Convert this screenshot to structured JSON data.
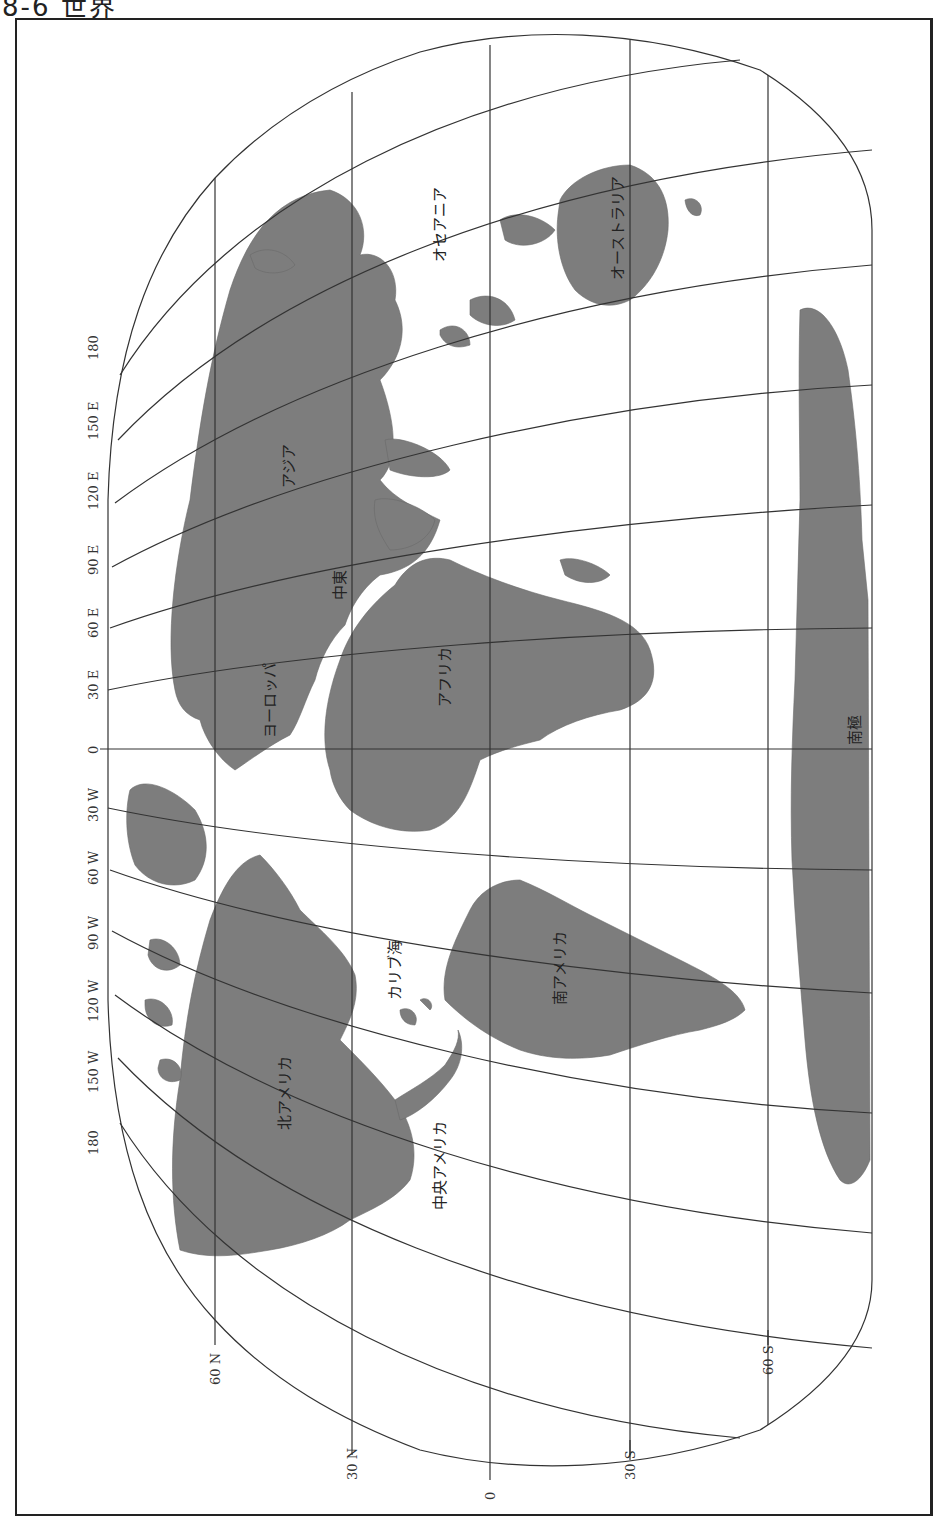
{
  "page": {
    "title": "8-6 世界"
  },
  "map": {
    "projection_orientation": "rotated 90° — north at left, south at right",
    "colors": {
      "land": "#7d7d7d",
      "water": "#ffffff",
      "gridlines": "#333333",
      "frame": "#222222"
    },
    "latitude_labels": [
      {
        "label": "60 N",
        "x": 215
      },
      {
        "label": "30 N",
        "x": 352
      },
      {
        "label": "0",
        "x": 490
      },
      {
        "label": "30 S",
        "x": 630
      },
      {
        "label": "60 S",
        "x": 768
      }
    ],
    "longitude_labels": [
      {
        "label": "180",
        "y": 345
      },
      {
        "label": "150 E",
        "y": 415
      },
      {
        "label": "120 E",
        "y": 490
      },
      {
        "label": "90 E",
        "y": 560
      },
      {
        "label": "60 E",
        "y": 630
      },
      {
        "label": "30 E",
        "y": 690
      },
      {
        "label": "0",
        "y": 749
      },
      {
        "label": "30 W",
        "y": 808
      },
      {
        "label": "60 W",
        "y": 868
      },
      {
        "label": "90 W",
        "y": 935
      },
      {
        "label": "120 W",
        "y": 1003
      },
      {
        "label": "150 W",
        "y": 1075
      },
      {
        "label": "180",
        "y": 1140
      }
    ],
    "regions": [
      {
        "name": "オセアニア",
        "x": 440,
        "y": 220
      },
      {
        "name": "オーストラリア",
        "x": 618,
        "y": 230
      },
      {
        "name": "アジア",
        "x": 290,
        "y": 470
      },
      {
        "name": "中東",
        "x": 340,
        "y": 585
      },
      {
        "name": "ヨーロッパ",
        "x": 270,
        "y": 690
      },
      {
        "name": "アフリカ",
        "x": 445,
        "y": 670
      },
      {
        "name": "南極",
        "x": 855,
        "y": 725
      },
      {
        "name": "カリブ海",
        "x": 395,
        "y": 955
      },
      {
        "name": "南アメリカ",
        "x": 560,
        "y": 955
      },
      {
        "name": "北アメリカ",
        "x": 285,
        "y": 1085
      },
      {
        "name": "中央アメリカ",
        "x": 440,
        "y": 1150
      }
    ]
  }
}
